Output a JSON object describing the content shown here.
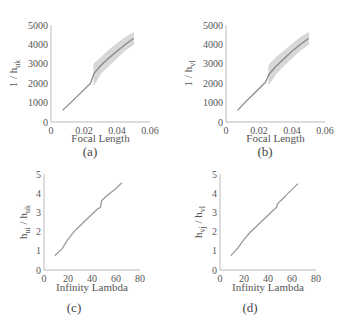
{
  "chart_data": [
    {
      "id": "a",
      "type": "line",
      "caption": "(a)",
      "title": "",
      "xlabel": "Focal Length",
      "ylabel": "1 / h_uk",
      "ylabel_main": "1 / h",
      "ylabel_sub": "uk",
      "xlim": [
        0,
        0.06
      ],
      "ylim": [
        0,
        5000
      ],
      "xticks": [
        "0",
        "0.02",
        "0.04",
        "0.06"
      ],
      "yticks": [
        "0",
        "1000",
        "2000",
        "3000",
        "4000",
        "5000"
      ],
      "grid": false,
      "series": [
        {
          "name": "mean",
          "x": [
            0.007,
            0.012,
            0.018,
            0.024,
            0.026,
            0.03,
            0.035,
            0.04,
            0.045,
            0.05
          ],
          "y": [
            600,
            1000,
            1500,
            2000,
            2500,
            2900,
            3300,
            3650,
            4000,
            4300
          ],
          "color": "#888888"
        }
      ],
      "band": {
        "x": [
          0.026,
          0.03,
          0.035,
          0.04,
          0.045,
          0.05
        ],
        "lower": [
          1900,
          2500,
          2900,
          3300,
          3700,
          4000
        ],
        "upper": [
          3000,
          3300,
          3700,
          4050,
          4350,
          4600
        ],
        "color": "#d8d8d8"
      }
    },
    {
      "id": "b",
      "type": "line",
      "caption": "(b)",
      "title": "",
      "xlabel": "Focal Length",
      "ylabel": "1 / h_vl",
      "ylabel_main": "1 / h",
      "ylabel_sub": "vl",
      "xlim": [
        0,
        0.06
      ],
      "ylim": [
        0,
        5000
      ],
      "xticks": [
        "0",
        "0.02",
        "0.04",
        "0.06"
      ],
      "yticks": [
        "0",
        "1000",
        "2000",
        "3000",
        "4000",
        "5000"
      ],
      "grid": false,
      "series": [
        {
          "name": "mean",
          "x": [
            0.007,
            0.012,
            0.018,
            0.024,
            0.026,
            0.03,
            0.035,
            0.04,
            0.045,
            0.05
          ],
          "y": [
            600,
            1050,
            1550,
            2050,
            2450,
            2850,
            3250,
            3650,
            4000,
            4300
          ],
          "color": "#888888"
        }
      ],
      "band": {
        "x": [
          0.026,
          0.03,
          0.035,
          0.04,
          0.045,
          0.05
        ],
        "lower": [
          1950,
          2450,
          2900,
          3300,
          3700,
          4000
        ],
        "upper": [
          2950,
          3300,
          3650,
          4000,
          4350,
          4600
        ],
        "color": "#d8d8d8"
      }
    },
    {
      "id": "c",
      "type": "line",
      "caption": "(c)",
      "title": "",
      "xlabel": "Infinity Lambda",
      "ylabel": "h_ui / h_uk",
      "ylabel_main": "h",
      "ylabel_sub": "ui",
      "ylabel_main2": " / h",
      "ylabel_sub2": "uk",
      "xlim": [
        0,
        80
      ],
      "ylim": [
        0,
        5
      ],
      "xticks": [
        "0",
        "20",
        "40",
        "60",
        "80"
      ],
      "yticks": [
        "0",
        "1",
        "2",
        "3",
        "4",
        "5"
      ],
      "grid": false,
      "series": [
        {
          "name": "ratio",
          "x": [
            9,
            15,
            20,
            25,
            30,
            35,
            40,
            45,
            47,
            48,
            52,
            56,
            60,
            65
          ],
          "y": [
            0.75,
            1.1,
            1.6,
            2.0,
            2.3,
            2.6,
            2.9,
            3.2,
            3.25,
            3.6,
            3.85,
            4.05,
            4.25,
            4.55
          ],
          "color": "#999999"
        }
      ]
    },
    {
      "id": "d",
      "type": "line",
      "caption": "(d)",
      "title": "",
      "xlabel": "Infinity Lambda",
      "ylabel": "h_vj / h_vl",
      "ylabel_main": "h",
      "ylabel_sub": "vj",
      "ylabel_main2": " / h",
      "ylabel_sub2": "vl",
      "xlim": [
        0,
        80
      ],
      "ylim": [
        0,
        5
      ],
      "xticks": [
        "0",
        "20",
        "40",
        "60",
        "80"
      ],
      "yticks": [
        "0",
        "1",
        "2",
        "3",
        "4",
        "5"
      ],
      "grid": false,
      "series": [
        {
          "name": "ratio",
          "x": [
            9,
            15,
            20,
            25,
            30,
            35,
            40,
            45,
            47,
            48,
            52,
            56,
            60,
            65
          ],
          "y": [
            0.75,
            1.15,
            1.6,
            1.95,
            2.25,
            2.55,
            2.85,
            3.15,
            3.25,
            3.45,
            3.7,
            3.95,
            4.2,
            4.5
          ],
          "color": "#999999"
        }
      ]
    }
  ]
}
